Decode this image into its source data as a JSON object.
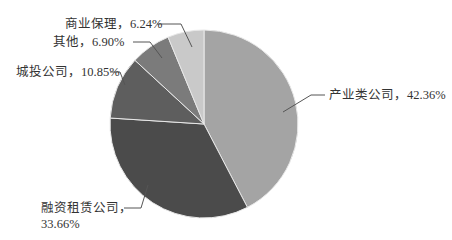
{
  "chart_data": {
    "type": "pie",
    "title": "",
    "start_angle_deg": 0,
    "direction": "clockwise",
    "categories": [
      "产业类公司",
      "融资租赁公司",
      "城投公司",
      "其他",
      "商业保理"
    ],
    "values": [
      42.36,
      33.66,
      10.85,
      6.9,
      6.24
    ],
    "unit": "%",
    "colors": [
      "#a4a4a4",
      "#4b4b4b",
      "#5e5e5e",
      "#7b7b7b",
      "#c9c9c9"
    ],
    "labels": [
      {
        "name": "产业类公司",
        "text": "产业类公司，42.36%"
      },
      {
        "name": "融资租赁公司",
        "line1": "融资租赁公司，",
        "line2": "33.66%"
      },
      {
        "name": "城投公司",
        "text": "城投公司，10.85%"
      },
      {
        "name": "其他",
        "text": "其他，6.90%"
      },
      {
        "name": "商业保理",
        "text": "商业保理，6.24%"
      }
    ],
    "legend": "none (inline labels with leader lines)",
    "grid": false
  }
}
